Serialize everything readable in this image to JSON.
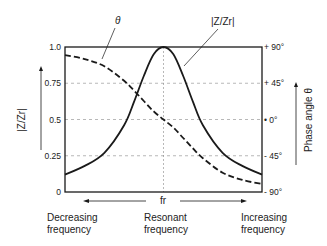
{
  "chart_data": {
    "type": "line",
    "title": "",
    "xlabel": "fr",
    "ylabel_left": "|Z/Zr|",
    "ylabel_right": "Phase angle θ",
    "x_domain": [
      -1,
      1
    ],
    "ylim_left": [
      0,
      1.0
    ],
    "ylim_right": [
      -90,
      90
    ],
    "left_ticks": [
      "0",
      "0.25",
      "0.5",
      "0.75",
      "1.0"
    ],
    "left_tick_values": [
      0,
      0.25,
      0.5,
      0.75,
      1.0
    ],
    "right_ticks": [
      "- 90°",
      "- 45°",
      "• 0°",
      "+ 45°",
      "+ 90°"
    ],
    "right_tick_values": [
      -90,
      -45,
      0,
      45,
      90
    ],
    "grid": true,
    "grid_style": "dashed horizontal at 0.25/0.5/0.75, dotted vertical at fr",
    "series": [
      {
        "name": "|Z/Zr|",
        "axis": "left",
        "style": "solid",
        "x": [
          -1.0,
          -0.8,
          -0.6,
          -0.4,
          -0.3,
          -0.2,
          -0.1,
          0.0,
          0.1,
          0.2,
          0.3,
          0.4,
          0.6,
          0.8,
          1.0
        ],
        "values": [
          0.12,
          0.18,
          0.27,
          0.46,
          0.62,
          0.8,
          0.95,
          1.0,
          0.95,
          0.8,
          0.62,
          0.46,
          0.27,
          0.18,
          0.12
        ]
      },
      {
        "name": "θ",
        "axis": "right",
        "style": "dashed",
        "x": [
          -1.0,
          -0.8,
          -0.6,
          -0.4,
          -0.3,
          -0.2,
          -0.1,
          0.0,
          0.1,
          0.2,
          0.3,
          0.4,
          0.6,
          0.8,
          1.0
        ],
        "values": [
          80,
          75,
          66,
          48,
          36,
          23,
          10,
          0,
          -10,
          -23,
          -36,
          -48,
          -66,
          -75,
          -80
        ]
      }
    ],
    "annotations": [
      {
        "text": "θ",
        "points_to": "θ curve"
      },
      {
        "text": "|Z/Zr|",
        "points_to": "|Z/Zr| curve"
      }
    ],
    "x_captions": {
      "left": [
        "Decreasing",
        "frequency"
      ],
      "center": [
        "Resonant",
        "frequency"
      ],
      "right": [
        "Increasing",
        "frequency"
      ]
    }
  },
  "labels": {
    "theta_label": "θ",
    "z_label": "|Z/Zr|",
    "left_axis_title": "|Z/Zr|",
    "right_axis_title": "Phase angle θ",
    "fr": "fr",
    "dec1": "Decreasing",
    "dec2": "frequency",
    "res1": "Resonant",
    "res2": "frequency",
    "inc1": "Increasing",
    "inc2": "frequency"
  },
  "colors": {
    "line": "#1a1a1a",
    "grid": "#888888",
    "text": "#222222"
  }
}
